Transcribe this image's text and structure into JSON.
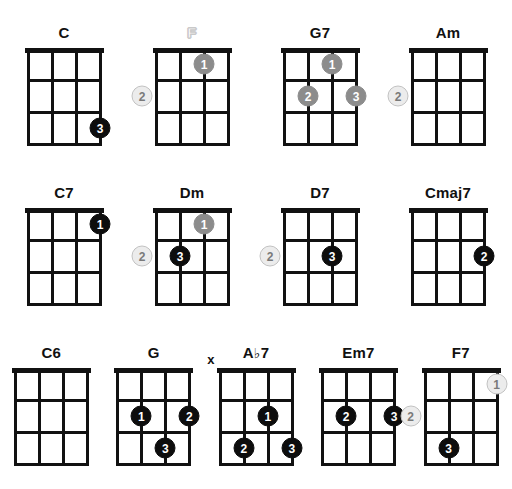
{
  "sheet": {
    "title": "Ukulele Chord Chart",
    "strings": 4,
    "frets": 3,
    "dot_styles": [
      "solid",
      "gray",
      "outline"
    ],
    "colors": {
      "grid": "#111111",
      "dot_solid": "#0d0d0d",
      "dot_gray": "#8c8c8c",
      "dot_outline_fill": "#ececec",
      "dot_outline_border": "#c2c2c2",
      "ghost_label": "#c9c9c9",
      "background": "#ffffff"
    }
  },
  "rows": [
    {
      "chords": [
        {
          "name": "C",
          "label_style": "bold",
          "mute_markers": [],
          "dots": [
            {
              "finger": "3",
              "string": 4,
              "fret": 3,
              "style": "solid",
              "placement": "grid"
            }
          ]
        },
        {
          "name": "F",
          "label_style": "ghost",
          "mute_markers": [],
          "dots": [
            {
              "finger": "1",
              "string": 3,
              "fret": 1,
              "style": "gray",
              "placement": "grid"
            },
            {
              "finger": "2",
              "string": 1,
              "fret": 2,
              "style": "outline",
              "placement": "left-outside"
            }
          ]
        },
        {
          "name": "G7",
          "label_style": "bold",
          "mute_markers": [],
          "dots": [
            {
              "finger": "1",
              "string": 3,
              "fret": 1,
              "style": "gray",
              "placement": "grid"
            },
            {
              "finger": "2",
              "string": 2,
              "fret": 2,
              "style": "gray",
              "placement": "grid"
            },
            {
              "finger": "3",
              "string": 4,
              "fret": 2,
              "style": "gray",
              "placement": "grid"
            }
          ]
        },
        {
          "name": "Am",
          "label_style": "bold",
          "mute_markers": [],
          "dots": [
            {
              "finger": "2",
              "string": 1,
              "fret": 2,
              "style": "outline",
              "placement": "left-outside"
            }
          ]
        }
      ]
    },
    {
      "chords": [
        {
          "name": "C7",
          "label_style": "bold",
          "mute_markers": [],
          "dots": [
            {
              "finger": "1",
              "string": 4,
              "fret": 1,
              "style": "solid",
              "placement": "grid"
            }
          ]
        },
        {
          "name": "Dm",
          "label_style": "bold",
          "mute_markers": [],
          "dots": [
            {
              "finger": "1",
              "string": 3,
              "fret": 1,
              "style": "gray",
              "placement": "grid"
            },
            {
              "finger": "2",
              "string": 1,
              "fret": 2,
              "style": "outline",
              "placement": "left-outside"
            },
            {
              "finger": "3",
              "string": 2,
              "fret": 2,
              "style": "solid",
              "placement": "grid"
            }
          ]
        },
        {
          "name": "D7",
          "label_style": "bold",
          "mute_markers": [],
          "dots": [
            {
              "finger": "2",
              "string": 1,
              "fret": 2,
              "style": "outline",
              "placement": "left-outside"
            },
            {
              "finger": "3",
              "string": 3,
              "fret": 2,
              "style": "solid",
              "placement": "grid"
            }
          ]
        },
        {
          "name": "Cmaj7",
          "label_style": "bold",
          "mute_markers": [],
          "dots": [
            {
              "finger": "2",
              "string": 4,
              "fret": 2,
              "style": "solid",
              "placement": "grid"
            }
          ]
        }
      ]
    },
    {
      "chords": [
        {
          "name": "C6",
          "label_style": "bold",
          "mute_markers": [],
          "dots": []
        },
        {
          "name": "G",
          "label_style": "bold",
          "mute_markers": [],
          "dots": [
            {
              "finger": "1",
              "string": 2,
              "fret": 2,
              "style": "solid",
              "placement": "grid"
            },
            {
              "finger": "2",
              "string": 4,
              "fret": 2,
              "style": "solid",
              "placement": "grid"
            },
            {
              "finger": "3",
              "string": 3,
              "fret": 3,
              "style": "solid",
              "placement": "grid"
            }
          ]
        },
        {
          "name": "A♭7",
          "label_style": "bold",
          "mute_markers": [
            {
              "string": 1,
              "symbol": "x"
            }
          ],
          "dots": [
            {
              "finger": "1",
              "string": 3,
              "fret": 2,
              "style": "solid",
              "placement": "grid"
            },
            {
              "finger": "2",
              "string": 2,
              "fret": 3,
              "style": "solid",
              "placement": "grid"
            },
            {
              "finger": "3",
              "string": 4,
              "fret": 3,
              "style": "solid",
              "placement": "grid"
            }
          ]
        },
        {
          "name": "Em7",
          "label_style": "bold",
          "mute_markers": [],
          "dots": [
            {
              "finger": "2",
              "string": 2,
              "fret": 2,
              "style": "solid",
              "placement": "grid"
            },
            {
              "finger": "3",
              "string": 4,
              "fret": 2,
              "style": "solid",
              "placement": "grid"
            }
          ]
        },
        {
          "name": "F7",
          "label_style": "bold",
          "mute_markers": [],
          "dots": [
            {
              "finger": "1",
              "string": 4,
              "fret": 1,
              "style": "outline",
              "placement": "grid"
            },
            {
              "finger": "2",
              "string": 1,
              "fret": 2,
              "style": "outline",
              "placement": "left-outside"
            },
            {
              "finger": "3",
              "string": 2,
              "fret": 3,
              "style": "solid",
              "placement": "grid"
            }
          ]
        }
      ]
    }
  ]
}
